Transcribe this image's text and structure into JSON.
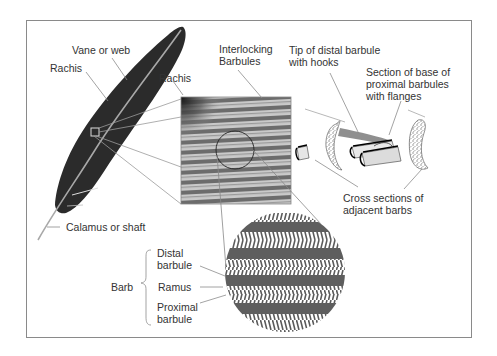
{
  "figure": {
    "labels": {
      "vane": "Vane or web",
      "rachis_feather": "Rachis",
      "rachis_zoom": "Rachis",
      "calamus": "Calamus or shaft",
      "interlocking": [
        "Interlocking",
        "Barbules"
      ],
      "tip_distal": [
        "Tip of distal barbule",
        "with hooks"
      ],
      "section_base": [
        "Section of base of",
        "proximal barbules",
        "with flanges"
      ],
      "cross_sections": [
        "Cross sections of",
        "adjacent barbs"
      ],
      "barb": "Barb",
      "distal": [
        "Distal",
        "barbule"
      ],
      "ramus": "Ramus",
      "proximal": [
        "Proximal",
        "barbule"
      ]
    },
    "colors": {
      "feather": "#2b2b2b",
      "rachis": "#a8a8a8",
      "frame": "#8a8a8a",
      "leader": "#8c8c8c",
      "texture_dark": "#6a6a6a",
      "texture_light": "#c8c8c8",
      "band_dark": "#5e5e5e",
      "text": "#333333"
    }
  }
}
